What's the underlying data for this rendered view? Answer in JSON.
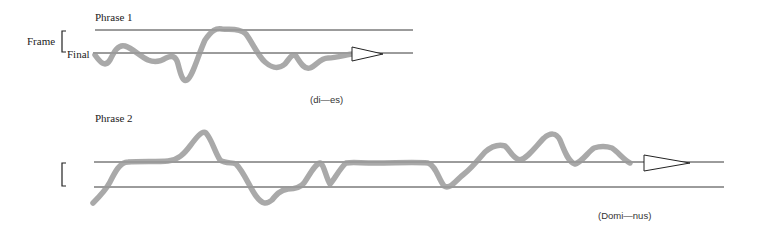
{
  "phrase1": {
    "title": "Phrase 1",
    "frame_label": "Frame",
    "final_label": "Final",
    "syllables": "(di—es)"
  },
  "phrase2": {
    "title": "Phrase 2",
    "syllables": "(Domi—nus)"
  },
  "colors": {
    "contour": "#9a9a9a",
    "lines": "#222222"
  }
}
